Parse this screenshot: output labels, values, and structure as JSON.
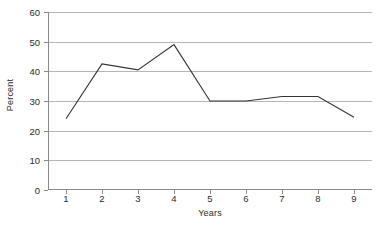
{
  "chart_data": {
    "type": "line",
    "title": "",
    "subtitle": "",
    "xlabel": "Years",
    "ylabel": "Percent",
    "x": [
      1,
      2,
      3,
      4,
      5,
      6,
      7,
      8,
      9
    ],
    "xticklabels": [
      "1",
      "2",
      "3",
      "4",
      "5",
      "6",
      "7",
      "8",
      "9"
    ],
    "yticklabels": [
      "0",
      "10",
      "20",
      "30",
      "40",
      "50",
      "60"
    ],
    "yticks": [
      0,
      10,
      20,
      30,
      40,
      50,
      60
    ],
    "ylim": [
      0,
      60
    ],
    "xlim": [
      0.5,
      9.5
    ],
    "grid": "horizontal",
    "legend": "none",
    "series": [
      {
        "name": "Percent",
        "values": [
          24,
          42.5,
          40.5,
          49,
          30,
          30,
          31.5,
          31.5,
          24.5
        ],
        "color": "#333333",
        "marker": "none",
        "line_width": 1
      }
    ],
    "annotations": [],
    "colors": {
      "background": "#ffffff",
      "axis": "#8a8a8a",
      "gridline": "#b5b5b5",
      "text": "#2b2b2b",
      "series_line": "#333333"
    }
  }
}
